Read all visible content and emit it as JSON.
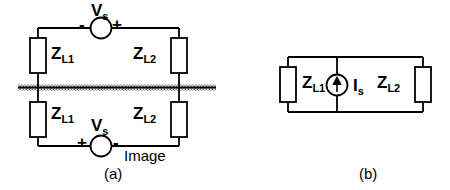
{
  "figure": {
    "caption_a": "(a)",
    "caption_b": "(b)",
    "colors": {
      "line": "#000000",
      "ground_hatch": "#808080",
      "background": "#ffffff"
    }
  },
  "circuit_a": {
    "name": "source above ground plane with image",
    "ground_plane_label": "Image",
    "top": {
      "source": {
        "label": "V",
        "subscript": "s",
        "terminal_left": "-",
        "terminal_right": "+"
      },
      "impedance_left": {
        "label": "Z",
        "subscript": "L1"
      },
      "impedance_right": {
        "label": "Z",
        "subscript": "L2"
      }
    },
    "bottom": {
      "source": {
        "label": "V",
        "subscript": "s",
        "terminal_left": "+",
        "terminal_right": "-"
      },
      "impedance_left": {
        "label": "Z",
        "subscript": "L1"
      },
      "impedance_right": {
        "label": "Z",
        "subscript": "L2"
      }
    }
  },
  "circuit_b": {
    "name": "equivalent current source circuit",
    "source": {
      "label": "I",
      "subscript": "s",
      "type": "current-source",
      "arrow_direction": "up"
    },
    "impedance_left": {
      "label": "Z",
      "subscript": "L1"
    },
    "impedance_right": {
      "label": "Z",
      "subscript": "L2"
    }
  }
}
